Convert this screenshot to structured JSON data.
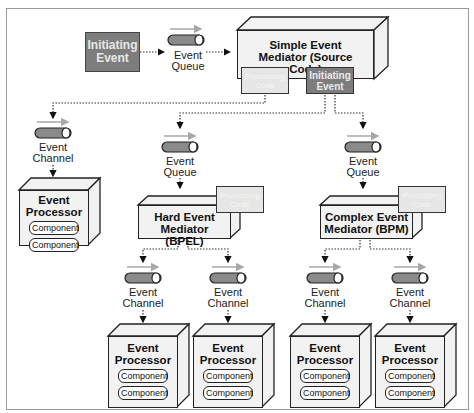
{
  "diagram": {
    "initiating_event": "Initiating Event",
    "top_queue": "Event Queue",
    "simple_mediator": {
      "title": "Simple Event Mediator (Source Code)",
      "processing_code": "Processing Code",
      "initiating_event": "Initiating Event"
    },
    "left_channel": "Event Channel",
    "left_processor": {
      "title": "Event Processor",
      "components": [
        "Component",
        "Component"
      ]
    },
    "hard_queue": "Event Queue",
    "hard_mediator": {
      "title": "Hard Event Mediator (BPEL)",
      "processing_code": "Processing Code"
    },
    "complex_queue": "Event Queue",
    "complex_mediator": {
      "title": "Complex Event Mediator (BPM)",
      "processing_code": "Processing Code"
    },
    "bottom_branches": [
      {
        "channel": "Event Channel",
        "processor": "Event Processor",
        "components": [
          "Component",
          "Component"
        ]
      },
      {
        "channel": "Event Channel",
        "processor": "Event Processor",
        "components": [
          "Component",
          "Component"
        ]
      },
      {
        "channel": "Event Channel",
        "processor": "Event Processor",
        "components": [
          "Component",
          "Component"
        ]
      },
      {
        "channel": "Event Channel",
        "processor": "Event Processor",
        "components": [
          "Component",
          "Component"
        ]
      }
    ],
    "colors": {
      "dark_fill": "#7d7d7d",
      "light_fill": "#f2f2f2",
      "pipe_fill": "#8a8a8a",
      "flow_arrow": "#a8a8a8",
      "line": "#222222"
    }
  }
}
